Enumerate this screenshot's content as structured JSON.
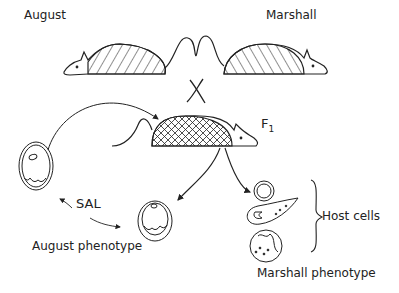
{
  "labels": {
    "august": "August",
    "marshall": "Marshall",
    "f1": "F",
    "f1_sub": "1",
    "sal": "SAL",
    "host_cells": "Host cells",
    "august_phenotype": "August phenotype",
    "marshall_phenotype": "Marshall phenotype"
  }
}
